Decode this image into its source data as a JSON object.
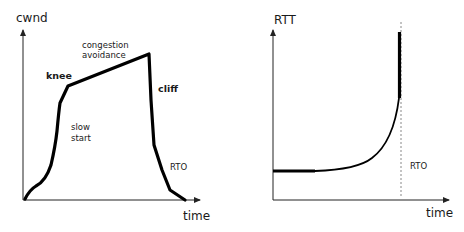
{
  "left_panel": {
    "y_axis_label": "cwnd",
    "x_axis_label": "time",
    "annotations": {
      "knee": "knee",
      "congestion_line1": "congestion",
      "congestion_line2": "avoidance",
      "cliff": "cliff",
      "slow_line1": "slow",
      "slow_line2": "start",
      "rto": "RTO"
    }
  },
  "right_panel": {
    "y_axis_label": "RTT",
    "x_axis_label": "time",
    "annotations": {
      "rto": "RTO"
    }
  },
  "colors": {
    "stroke": "#000000",
    "axis": "#222222",
    "dashed": "#888888"
  }
}
